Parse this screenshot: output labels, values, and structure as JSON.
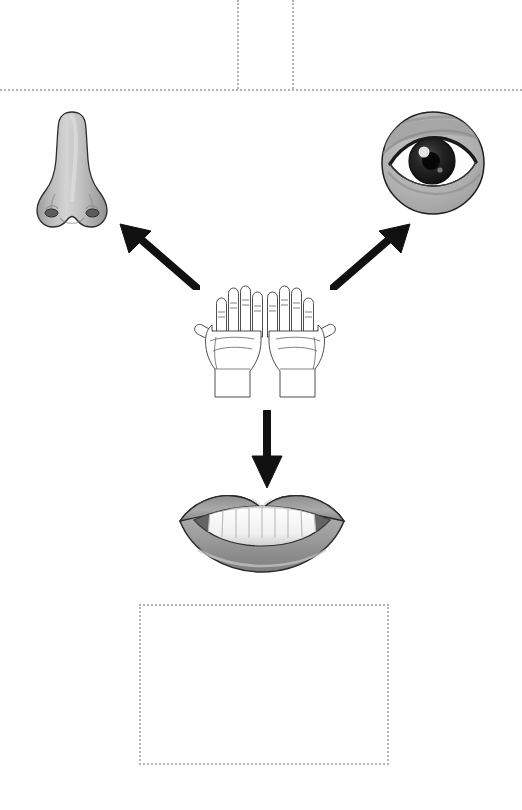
{
  "page": {
    "width": 522,
    "height": 810,
    "background": "#ffffff"
  },
  "colors": {
    "dotted_guide": "#b4b4b4",
    "arrow": "#111111",
    "outline": "#1a1a1a",
    "skin_light": "#d0d0d0",
    "skin_mid": "#a8a8a8",
    "skin_dark": "#7d7d7d",
    "tooth_white": "#fdfdfd",
    "iris_dark": "#141414",
    "sclera": "#ffffff"
  },
  "guides": {
    "horizontal_rule": {
      "label": "top-horizontal-divider",
      "x": 0,
      "y": 89,
      "width": 522
    },
    "vertical_left": {
      "label": "top-left-vertical-divider",
      "x": 237,
      "y": 0,
      "height": 89
    },
    "vertical_right": {
      "label": "top-right-vertical-divider",
      "x": 292,
      "y": 0,
      "height": 89
    },
    "answer_box": {
      "label": "empty-answer-box",
      "x": 139,
      "y": 604,
      "width": 246,
      "height": 157
    }
  },
  "figures": [
    {
      "id": "nose",
      "label": "nose",
      "caption": "Nose",
      "x": 34,
      "y": 108,
      "width": 76,
      "height": 124
    },
    {
      "id": "eye",
      "label": "eye",
      "caption": "Eye",
      "x": 380,
      "y": 110,
      "width": 106,
      "height": 106
    },
    {
      "id": "hands",
      "label": "hands",
      "caption": "Hands",
      "x": 194,
      "y": 279,
      "width": 142,
      "height": 122
    },
    {
      "id": "mouth",
      "label": "mouth",
      "caption": "Mouth",
      "x": 176,
      "y": 490,
      "width": 172,
      "height": 86
    }
  ],
  "arrows": [
    {
      "id": "arrow-to-nose",
      "label": "arrow-up-left-to-nose",
      "direction": "up-left",
      "x": 115,
      "y": 222,
      "width": 85,
      "height": 68
    },
    {
      "id": "arrow-to-eye",
      "label": "arrow-up-right-to-eye",
      "direction": "up-right",
      "x": 330,
      "y": 222,
      "width": 85,
      "height": 68
    },
    {
      "id": "arrow-to-mouth",
      "label": "arrow-down-to-mouth",
      "direction": "down",
      "x": 250,
      "y": 410,
      "width": 34,
      "height": 80
    }
  ]
}
